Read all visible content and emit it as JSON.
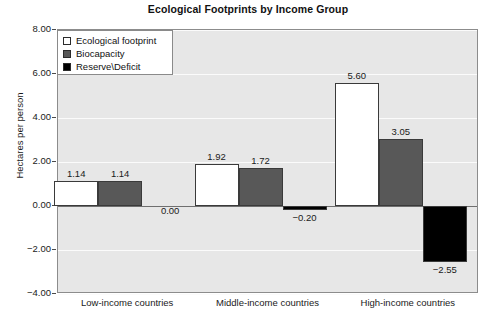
{
  "chart_data": {
    "type": "bar",
    "title": "Ecological Footprints by Income Group",
    "xlabel": "",
    "ylabel": "Hectares per person",
    "ylim": [
      -4.0,
      8.0
    ],
    "ytick_step": 2.0,
    "ytick_labels": [
      "8.00",
      "6.00",
      "4.00",
      "2.00",
      "0.00",
      "-2.00",
      "-4.00"
    ],
    "ytick_values": [
      8.0,
      6.0,
      4.0,
      2.0,
      0.0,
      -2.0,
      -4.0
    ],
    "grid": true,
    "legend_position": "top-left",
    "categories": [
      "Low-income countries",
      "Middle-income countries",
      "High-income countries"
    ],
    "series": [
      {
        "name": "Ecological footprint",
        "color": "#ffffff",
        "values": [
          1.14,
          1.92,
          5.6
        ],
        "labels": [
          "1.14",
          "1.92",
          "5.60"
        ]
      },
      {
        "name": "Biocapacity",
        "color": "#585858",
        "values": [
          1.14,
          1.72,
          3.05
        ],
        "labels": [
          "1.14",
          "1.72",
          "3.05"
        ]
      },
      {
        "name": "Reserve\\Deficit",
        "color": "#000000",
        "values": [
          0.0,
          -0.2,
          -2.55
        ],
        "labels": [
          "0.00",
          "−0.20",
          "−2.55"
        ]
      }
    ]
  },
  "legend": {
    "items": [
      {
        "label": "Ecological footprint",
        "swatch": "series-footprint"
      },
      {
        "label": "Biocapacity",
        "swatch": "series-biocapacity"
      },
      {
        "label": "Reserve\\Deficit",
        "swatch": "series-reserve"
      }
    ]
  },
  "colors": {
    "plot_background": "#e7e7e7",
    "gridline": "#fbfbfb",
    "axis": "#8c8c8c",
    "zero_line": "#6f6f6f",
    "bar_border": "#3a3a3a",
    "text": "#1a1a1a"
  }
}
